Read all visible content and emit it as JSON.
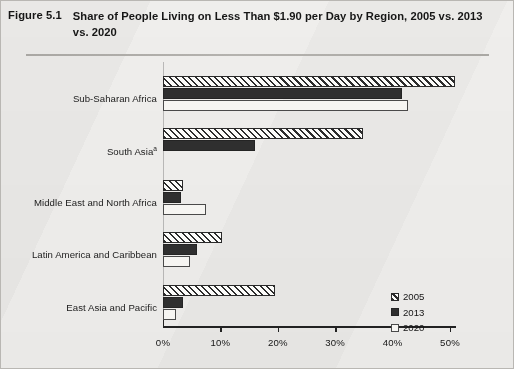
{
  "figure": {
    "number_label": "Figure 5.1",
    "title": "Share of People Living on Less Than $1.90 per Day by Region, 2005 vs. 2013 vs. 2020"
  },
  "legend": {
    "position": "inside-right",
    "entries": [
      {
        "label": "2005",
        "swatch": "hatched-diagonal",
        "color": "#2c2c2c"
      },
      {
        "label": "2013",
        "swatch": "solid-dark",
        "color": "#2f2f2f"
      },
      {
        "label": "2020",
        "swatch": "outline-white",
        "color": "#f6f5f2"
      }
    ]
  },
  "chart_data": {
    "type": "bar",
    "orientation": "horizontal",
    "title": "Share of People Living on Less Than $1.90 per Day by Region, 2005 vs. 2013 vs. 2020",
    "xlabel": "",
    "ylabel": "",
    "xlim": [
      0,
      51
    ],
    "xticks": [
      0,
      10,
      20,
      30,
      40,
      50
    ],
    "xtick_labels": [
      "0%",
      "10%",
      "20%",
      "30%",
      "40%",
      "50%"
    ],
    "grid": false,
    "unit": "%",
    "categories": [
      "Sub-Saharan Africa",
      "South Asia",
      "Middle East and North Africa",
      "Latin America and Caribbean",
      "East Asia and Pacific"
    ],
    "category_footnotes": [
      "",
      "a",
      "",
      "",
      ""
    ],
    "series": [
      {
        "name": "2005",
        "values": [
          50.9,
          34.8,
          3.5,
          10.3,
          19.5
        ]
      },
      {
        "name": "2013",
        "values": [
          41.6,
          16.0,
          3.1,
          5.9,
          3.5
        ]
      },
      {
        "name": "2020",
        "values": [
          42.7,
          0.0,
          7.5,
          4.7,
          2.3
        ]
      }
    ]
  }
}
